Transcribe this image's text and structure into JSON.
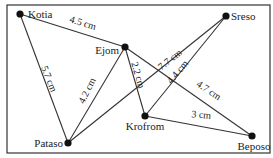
{
  "diagram": {
    "type": "weighted-graph",
    "frame": {
      "x": 7,
      "y": 5,
      "w": 263,
      "h": 148
    },
    "nodes": [
      {
        "id": "kotia",
        "label": "Kotia",
        "x": 20,
        "y": 14,
        "lx": 28,
        "ly": 18,
        "anchor": "start"
      },
      {
        "id": "ejom",
        "label": "Ejom",
        "x": 125,
        "y": 47,
        "lx": 119,
        "ly": 54,
        "anchor": "end"
      },
      {
        "id": "sreso",
        "label": "Sreso",
        "x": 226,
        "y": 16,
        "lx": 231,
        "ly": 20,
        "anchor": "start"
      },
      {
        "id": "pataso",
        "label": "Pataso",
        "x": 68,
        "y": 143,
        "lx": 63,
        "ly": 147,
        "anchor": "end"
      },
      {
        "id": "krofrom",
        "label": "Krofrom",
        "x": 145,
        "y": 116,
        "lx": 145,
        "ly": 130,
        "anchor": "middle"
      },
      {
        "id": "beposo",
        "label": "Beposo",
        "x": 252,
        "y": 136,
        "lx": 254,
        "ly": 150,
        "anchor": "middle"
      }
    ],
    "edges": [
      {
        "from": "kotia",
        "to": "ejom",
        "label": "4.5 cm",
        "lx": 82,
        "ly": 26,
        "rot": 17
      },
      {
        "from": "kotia",
        "to": "pataso",
        "label": "5.7 cm",
        "lx": 46,
        "ly": 80,
        "rot": 68
      },
      {
        "from": "ejom",
        "to": "pataso",
        "label": "4.2 cm",
        "lx": 90,
        "ly": 92,
        "rot": -64
      },
      {
        "from": "ejom",
        "to": "krofrom",
        "label": "2.2 cm",
        "lx": 135,
        "ly": 76,
        "rot": 74
      },
      {
        "from": "ejom",
        "to": "beposo",
        "label": "4.7 cm",
        "lx": 207,
        "ly": 93,
        "rot": 34
      },
      {
        "from": "pataso",
        "to": "sreso",
        "label": "7.7 cm",
        "lx": 172,
        "ly": 62,
        "rot": -38
      },
      {
        "from": "krofrom",
        "to": "sreso",
        "label": "4.4 cm",
        "lx": 180,
        "ly": 74,
        "rot": -50
      },
      {
        "from": "krofrom",
        "to": "beposo",
        "label": "3 cm",
        "lx": 201,
        "ly": 118,
        "rot": 4
      }
    ]
  }
}
